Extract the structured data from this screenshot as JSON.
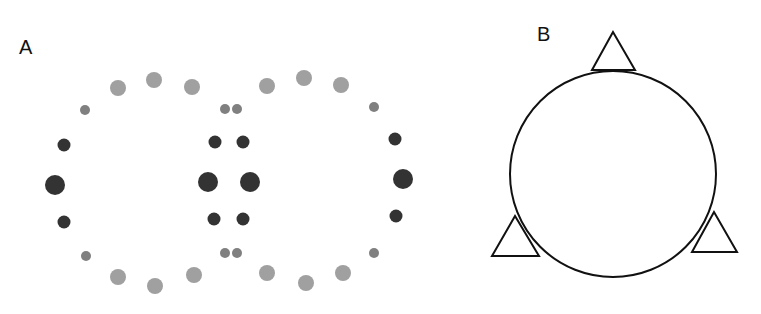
{
  "panels": {
    "a": {
      "label": "A",
      "colors": {
        "dark": "#333333",
        "mid": "#808080",
        "light": "#a0a0a0"
      },
      "dots": [
        {
          "x": 118,
          "y": 88,
          "r": 8,
          "tone": "light"
        },
        {
          "x": 154,
          "y": 80,
          "r": 8,
          "tone": "light"
        },
        {
          "x": 192,
          "y": 87,
          "r": 8,
          "tone": "light"
        },
        {
          "x": 85,
          "y": 110,
          "r": 5,
          "tone": "mid"
        },
        {
          "x": 64,
          "y": 145,
          "r": 6.5,
          "tone": "dark"
        },
        {
          "x": 55,
          "y": 185,
          "r": 10,
          "tone": "dark"
        },
        {
          "x": 64,
          "y": 222,
          "r": 6.5,
          "tone": "dark"
        },
        {
          "x": 86,
          "y": 256,
          "r": 5,
          "tone": "mid"
        },
        {
          "x": 118,
          "y": 277,
          "r": 8,
          "tone": "light"
        },
        {
          "x": 155,
          "y": 286,
          "r": 8,
          "tone": "light"
        },
        {
          "x": 194,
          "y": 275,
          "r": 8,
          "tone": "light"
        },
        {
          "x": 225,
          "y": 109,
          "r": 5,
          "tone": "mid"
        },
        {
          "x": 237,
          "y": 109,
          "r": 5,
          "tone": "mid"
        },
        {
          "x": 215,
          "y": 142,
          "r": 6.5,
          "tone": "dark"
        },
        {
          "x": 243,
          "y": 142,
          "r": 6.5,
          "tone": "dark"
        },
        {
          "x": 208,
          "y": 182,
          "r": 10,
          "tone": "dark"
        },
        {
          "x": 250,
          "y": 182,
          "r": 10,
          "tone": "dark"
        },
        {
          "x": 214,
          "y": 219,
          "r": 6.5,
          "tone": "dark"
        },
        {
          "x": 243,
          "y": 219,
          "r": 6.5,
          "tone": "dark"
        },
        {
          "x": 225,
          "y": 253,
          "r": 5,
          "tone": "mid"
        },
        {
          "x": 237,
          "y": 253,
          "r": 5,
          "tone": "mid"
        },
        {
          "x": 267,
          "y": 86,
          "r": 8,
          "tone": "light"
        },
        {
          "x": 304,
          "y": 78,
          "r": 8,
          "tone": "light"
        },
        {
          "x": 341,
          "y": 85,
          "r": 8,
          "tone": "light"
        },
        {
          "x": 374,
          "y": 107,
          "r": 5,
          "tone": "mid"
        },
        {
          "x": 395,
          "y": 139,
          "r": 6.5,
          "tone": "dark"
        },
        {
          "x": 403,
          "y": 179,
          "r": 10,
          "tone": "dark"
        },
        {
          "x": 396,
          "y": 216,
          "r": 6.5,
          "tone": "dark"
        },
        {
          "x": 374,
          "y": 253,
          "r": 5,
          "tone": "mid"
        },
        {
          "x": 267,
          "y": 273,
          "r": 8,
          "tone": "light"
        },
        {
          "x": 306,
          "y": 283,
          "r": 8,
          "tone": "light"
        },
        {
          "x": 343,
          "y": 273,
          "r": 8,
          "tone": "light"
        }
      ]
    },
    "b": {
      "label": "B",
      "stroke": "#111111",
      "circle": {
        "cx": 613,
        "cy": 174,
        "r": 103
      },
      "triangles": [
        {
          "name": "top",
          "points": "613,32 592,70 635,70"
        },
        {
          "name": "lower-left",
          "points": "515,216 492,256 539,256"
        },
        {
          "name": "lower-right",
          "points": "714,212 692,252 737,252"
        }
      ]
    }
  }
}
